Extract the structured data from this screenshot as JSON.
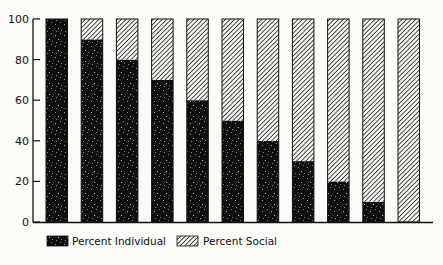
{
  "chart_data": {
    "type": "bar",
    "stacked": true,
    "title": "",
    "xlabel": "",
    "ylabel": "",
    "ylim": [
      0,
      100
    ],
    "yticks": [
      0,
      20,
      40,
      60,
      80,
      100
    ],
    "categories": [
      "1",
      "2",
      "3",
      "4",
      "5",
      "6",
      "7",
      "8",
      "9",
      "10",
      "11"
    ],
    "series": [
      {
        "name": "Percent Individual",
        "pattern": "black-speckled",
        "values": [
          100,
          90,
          80,
          70,
          60,
          50,
          40,
          30,
          20,
          10,
          0
        ]
      },
      {
        "name": "Percent Social",
        "pattern": "diagonal-hatch",
        "values": [
          0,
          10,
          20,
          30,
          40,
          50,
          60,
          70,
          80,
          90,
          100
        ]
      }
    ],
    "legend_position": "bottom",
    "grid": false
  },
  "legend": {
    "individual_label": "Percent Individual",
    "social_label": "Percent Social"
  },
  "colors": {
    "individual": "#0e0e0e",
    "social_stroke": "#222222",
    "background": "#fbfbf8"
  }
}
